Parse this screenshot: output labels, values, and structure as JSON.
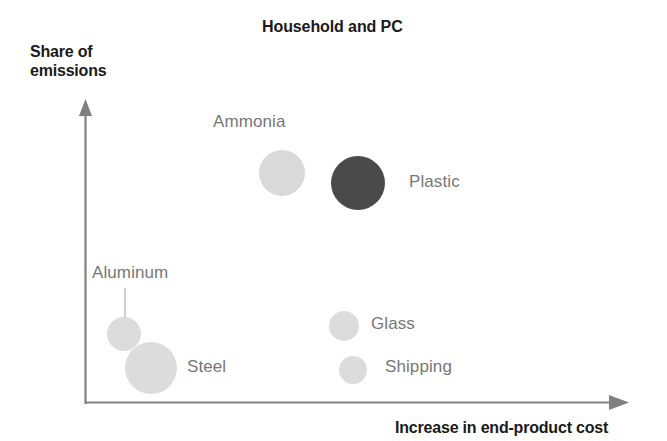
{
  "chart_data": {
    "type": "scatter",
    "title": "Household and PC",
    "xlabel": "Increase in end-product cost",
    "ylabel": "Share of emissions",
    "grid": false,
    "legend": "none",
    "axes": {
      "x_arrow": true,
      "y_arrow": true,
      "ticks": "none",
      "xlim_label": "qualitative",
      "ylim_label": "qualitative"
    },
    "note": "Qualitative bubble chart: x = increase in end-product cost, y = share of emissions, bubble area = magnitude",
    "points": [
      {
        "name": "Ammonia",
        "cx": 282,
        "cy": 173,
        "r": 23,
        "color": "#d9d9d9",
        "label_x": 213,
        "label_y": 112,
        "leader": false,
        "x_rank": "medium",
        "y_rank": "high",
        "size_rank": "medium"
      },
      {
        "name": "Plastic",
        "cx": 358,
        "cy": 183,
        "r": 27,
        "color": "#4a4a4a",
        "label_x": 409,
        "label_y": 172,
        "leader": false,
        "x_rank": "medium-high",
        "y_rank": "high",
        "size_rank": "large"
      },
      {
        "name": "Aluminum",
        "cx": 124,
        "cy": 334,
        "r": 17,
        "color": "#dcdcdc",
        "label_x": 92,
        "label_y": 263,
        "leader": true,
        "leader_x1": 125,
        "leader_y1": 288,
        "leader_x2": 125,
        "leader_y2": 318,
        "x_rank": "low",
        "y_rank": "low",
        "size_rank": "small"
      },
      {
        "name": "Steel",
        "cx": 151,
        "cy": 368,
        "r": 26,
        "color": "#dcdcdc",
        "label_x": 187,
        "label_y": 357,
        "leader": false,
        "x_rank": "low",
        "y_rank": "low",
        "size_rank": "large"
      },
      {
        "name": "Glass",
        "cx": 344,
        "cy": 326,
        "r": 15,
        "color": "#dcdcdc",
        "label_x": 371,
        "label_y": 314,
        "leader": false,
        "x_rank": "medium",
        "y_rank": "low",
        "size_rank": "small"
      },
      {
        "name": "Shipping",
        "cx": 353,
        "cy": 370,
        "r": 14,
        "color": "#dcdcdc",
        "label_x": 385,
        "label_y": 357,
        "leader": false,
        "x_rank": "medium",
        "y_rank": "low",
        "size_rank": "small"
      }
    ],
    "colors": {
      "axis": "#808080",
      "bubble_light": "#dcdcdc",
      "bubble_dark": "#4a4a4a",
      "label_text": "#777777",
      "title_text": "#1a1a1a",
      "background": "#ffffff"
    }
  }
}
